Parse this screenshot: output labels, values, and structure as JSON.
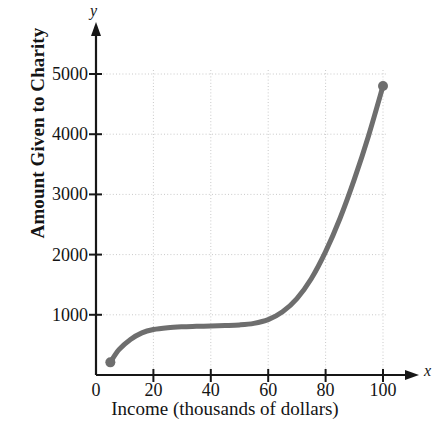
{
  "chart_data": {
    "type": "line",
    "title": "",
    "xlabel": "Income (thousands of dollars)",
    "ylabel": "Amount Given to Charity",
    "x_axis_variable": "x",
    "y_axis_variable": "y",
    "xlim": [
      0,
      110
    ],
    "ylim": [
      0,
      5400
    ],
    "xticks": [
      0,
      20,
      40,
      60,
      80,
      100
    ],
    "xtick_labels": [
      "0",
      "20",
      "40",
      "60",
      "80",
      "100"
    ],
    "yticks": [
      1000,
      2000,
      3000,
      4000,
      5000
    ],
    "ytick_labels": [
      "1000",
      "2000",
      "3000",
      "4000",
      "5000"
    ],
    "grid": true,
    "grid_style": "dotted",
    "legend": null,
    "series": [
      {
        "name": "Amount Given to Charity",
        "color": "#6e6e6e",
        "line_width": 5,
        "endpoint_markers": true,
        "x": [
          5,
          8,
          12,
          16,
          20,
          25,
          30,
          35,
          40,
          45,
          50,
          55,
          60,
          65,
          70,
          75,
          80,
          85,
          90,
          95,
          100
        ],
        "y": [
          210,
          420,
          590,
          700,
          755,
          785,
          800,
          808,
          815,
          822,
          832,
          858,
          920,
          1050,
          1270,
          1600,
          2050,
          2600,
          3250,
          3980,
          4800
        ]
      }
    ],
    "endpoints": [
      {
        "name": "start-point",
        "x": 5,
        "y": 210
      },
      {
        "name": "end-point",
        "x": 100,
        "y": 4800
      }
    ],
    "colors": {
      "curve": "#6e6e6e",
      "axis": "#171717",
      "grid": "#c9c9c9",
      "text": "#141414",
      "background": "#ffffff"
    }
  }
}
